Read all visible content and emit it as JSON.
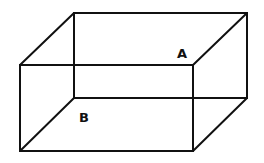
{
  "diagram": {
    "type": "rectangular-box-wireframe",
    "labels": [
      {
        "id": "A",
        "text": "A",
        "x": 177,
        "y": 47
      },
      {
        "id": "B",
        "text": "B",
        "x": 79,
        "y": 111
      }
    ],
    "vertices": {
      "front_top_left": [
        20,
        65
      ],
      "front_top_right": [
        193,
        65
      ],
      "front_bottom_left": [
        20,
        151
      ],
      "front_bottom_right": [
        193,
        151
      ],
      "back_top_left": [
        74,
        13
      ],
      "back_top_right": [
        247,
        13
      ],
      "back_bottom_left": [
        74,
        98
      ],
      "back_bottom_right": [
        247,
        98
      ]
    },
    "stroke_color": "#111111"
  }
}
